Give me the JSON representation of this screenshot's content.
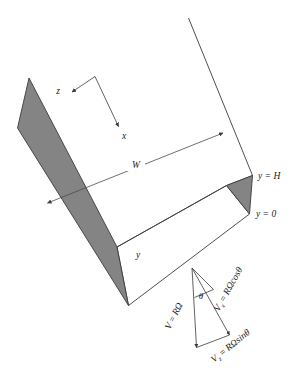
{
  "figure": {
    "background_color": "#ffffff",
    "wall_fill_color": "#848484",
    "line_color": "#3b3b3b"
  },
  "axes": {
    "z_label": "z",
    "x_label": "x",
    "y_label": "y"
  },
  "dimensions": {
    "width_label": "W",
    "y_top_label": "y = H",
    "y_bottom_label": "y = 0"
  },
  "velocity_triangle": {
    "angle_label": "θ",
    "resultant": {
      "symbol": "V",
      "equals": " = ",
      "expression": "RΩ",
      "full": "V = RΩ"
    },
    "x_component": {
      "symbol": "V",
      "subscript": "x",
      "equals": " = ",
      "expression": "RΩcosθ",
      "full": "Vₓ = RΩcosθ"
    },
    "z_component": {
      "symbol": "V",
      "subscript": "z",
      "equals": " = ",
      "expression": "RΩsinθ",
      "full": "V_z = RΩsinθ"
    }
  }
}
